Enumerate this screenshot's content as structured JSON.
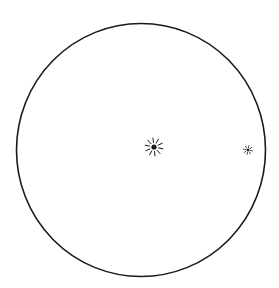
{
  "figure": {
    "type": "telescope-field-of-view-drawing",
    "background_color": "#ffffff",
    "ink_color": "#1a1a1a",
    "field": {
      "shape": "circle",
      "center": [
        141,
        150
      ],
      "radius": [
        124.5,
        126.5
      ],
      "stroke_width": 1.6
    },
    "objects": [
      {
        "name": "primary-star",
        "center": [
          154,
          147
        ],
        "dot_radius": 2.6,
        "ray_inner": 4.5,
        "ray_outer": 9,
        "rays": 10
      },
      {
        "name": "companion-star",
        "center": [
          248,
          150
        ],
        "dot_radius": 1.3,
        "ray_inner": 2.2,
        "ray_outer": 4.5,
        "rays": 8
      }
    ]
  }
}
